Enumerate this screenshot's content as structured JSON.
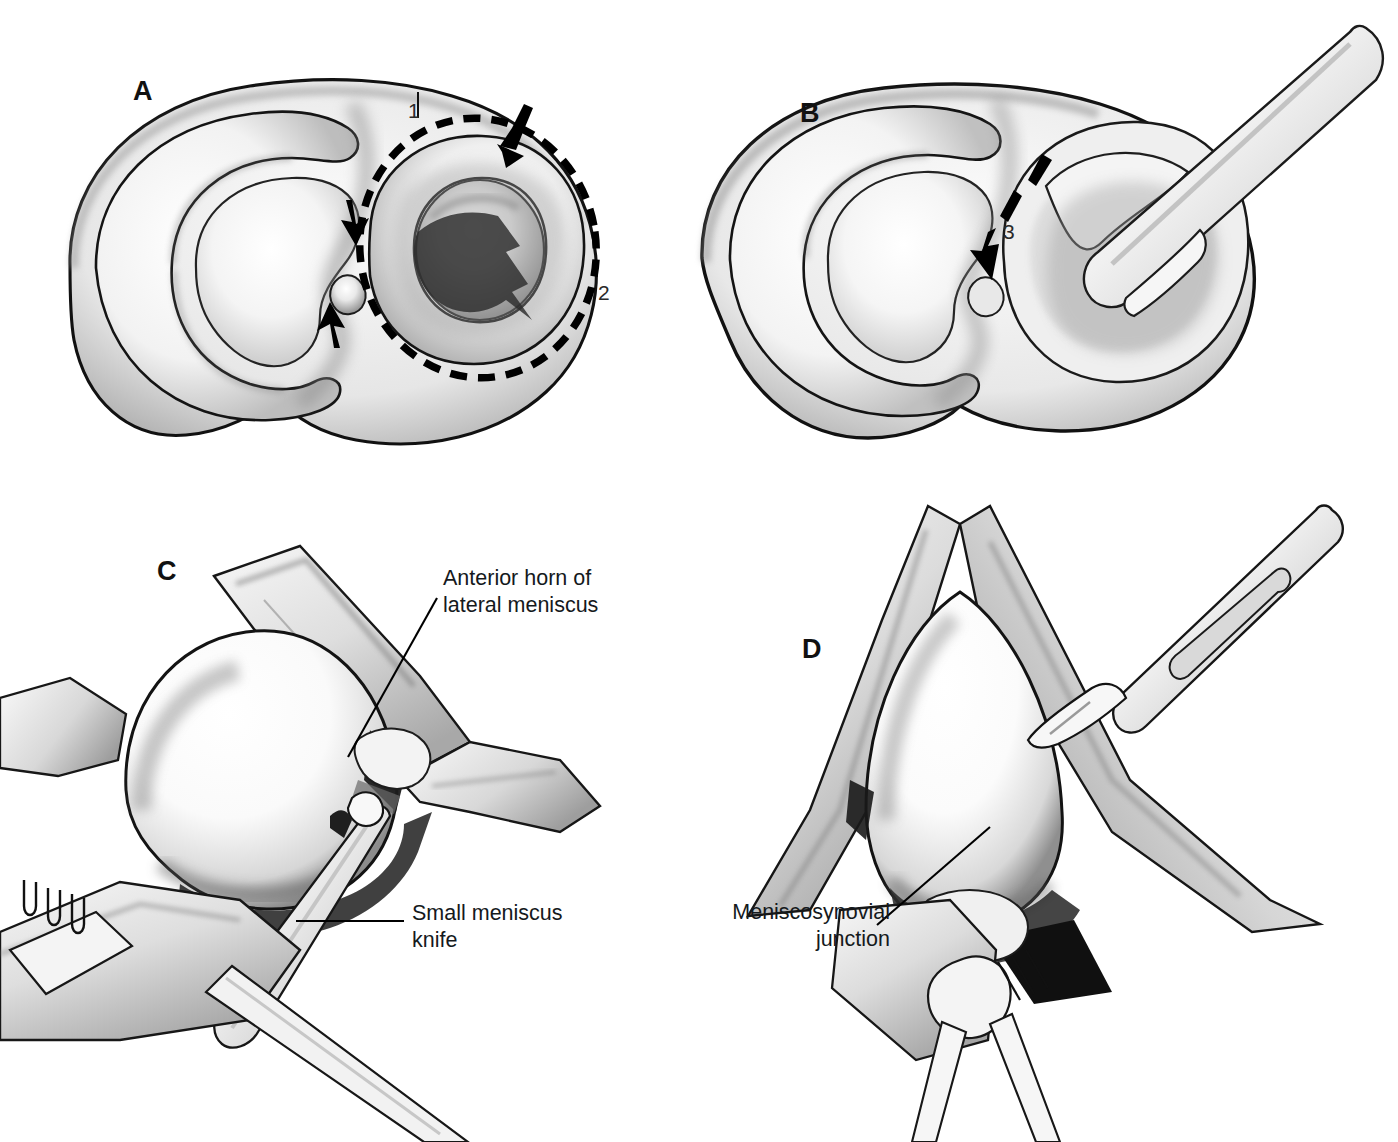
{
  "figure": {
    "background_color": "#ffffff",
    "ink_color": "#000000",
    "style": "pen-and-ink medical illustration, grayscale"
  },
  "panels": [
    {
      "id": "A",
      "letter": "A",
      "letter_pos": {
        "x": 133,
        "y": 78
      },
      "view": "Superior view of tibial plateau with both menisci",
      "annotations": [
        {
          "name": "label-1",
          "text": "1",
          "x": 408,
          "y": 100,
          "meaning": "first incision site at anterior horn of lateral meniscus"
        },
        {
          "name": "label-2",
          "text": "2",
          "x": 598,
          "y": 282,
          "meaning": "peripheral meniscosynovial detachment along lateral rim"
        }
      ],
      "markings": {
        "dashed_resection_line": true,
        "arrow_count": 3,
        "arrow_meaning": "direction of meniscal detachment, anterior to posterior"
      }
    },
    {
      "id": "B",
      "letter": "B",
      "letter_pos": {
        "x": 800,
        "y": 100
      },
      "view": "Superior view of tibial plateau with instrument released posterior horn",
      "annotations": [
        {
          "name": "label-3",
          "text": "3",
          "x": 1003,
          "y": 221,
          "meaning": "posterior horn division"
        }
      ],
      "markings": {
        "dashed_resection_line": false,
        "arrow_count": 1,
        "instrument": "meniscus clamp / grasper"
      }
    },
    {
      "id": "C",
      "letter": "C",
      "letter_pos": {
        "x": 157,
        "y": 558
      },
      "view": "Anterolateral arthrotomy exposure of the lateral compartment",
      "callouts": [
        {
          "name": "callout-anterior-horn",
          "text": "Anterior horn of\nlateral meniscus",
          "x": 443,
          "y": 565,
          "align": "left",
          "leader": {
            "type": "diagonal",
            "x1": 437,
            "y1": 598,
            "x2": 348,
            "y2": 757
          }
        },
        {
          "name": "callout-small-meniscus-knife",
          "text": "Small meniscus\nknife",
          "x": 412,
          "y": 900,
          "align": "left",
          "leader": {
            "type": "horizontal",
            "x1": 296,
            "y1": 921,
            "x2": 404,
            "y2": 921
          }
        }
      ],
      "instruments": [
        "rake retractor",
        "small meniscus knife",
        "blunt retractor"
      ]
    },
    {
      "id": "D",
      "letter": "D",
      "letter_pos": {
        "x": 802,
        "y": 636
      },
      "view": "Arthrotomy exposure with scalpel dividing the meniscosynovial junction",
      "callouts": [
        {
          "name": "callout-meniscosynovial-junction",
          "text": "Meniscosynovial\njunction",
          "x": 690,
          "y": 899,
          "align": "right",
          "leader": {
            "type": "diagonal",
            "x1": 877,
            "y1": 925,
            "x2": 990,
            "y2": 827
          }
        }
      ],
      "instruments": [
        "scalpel with no. 15 blade",
        "retractor",
        "tissue forceps"
      ]
    }
  ]
}
